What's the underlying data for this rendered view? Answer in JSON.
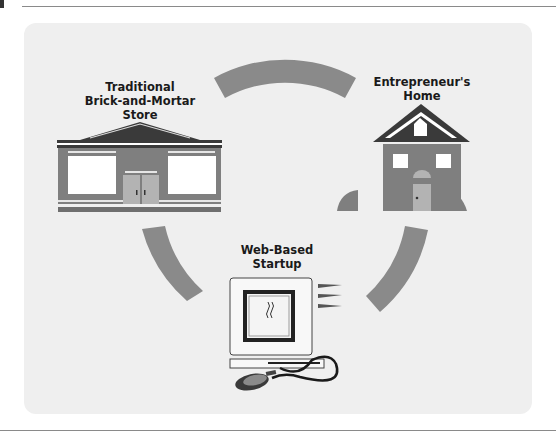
{
  "diagram": {
    "nodes": [
      {
        "id": "store",
        "label_line1": "Traditional",
        "label_line2": "Brick-and-Mortar Store",
        "icon": "storefront-icon"
      },
      {
        "id": "home",
        "label_line1": "Entrepreneur's",
        "label_line2": "Home",
        "icon": "house-icon"
      },
      {
        "id": "web",
        "label_line1": "Web-Based",
        "label_line2": "Startup",
        "icon": "computer-icon"
      }
    ],
    "connectors": [
      "arc-top",
      "arc-left",
      "arc-right"
    ],
    "colors": {
      "panel": "#efefef",
      "arc": "#8a8a8a",
      "building": "#7f7f7f",
      "roof": "#3a3a3a",
      "door": "#b3b3b3",
      "window": "#ffffff"
    }
  }
}
